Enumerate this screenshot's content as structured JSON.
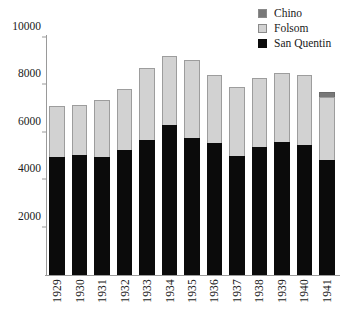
{
  "chart_data": {
    "type": "bar",
    "subtype": "stacked",
    "title": "",
    "xlabel": "",
    "ylabel": "",
    "categories": [
      "1929",
      "1930",
      "1931",
      "1932",
      "1933",
      "1934",
      "1935",
      "1936",
      "1937",
      "1938",
      "1939",
      "1940",
      "1941"
    ],
    "series": [
      {
        "name": "San Quentin",
        "color": "#0b0b0b",
        "values": [
          4980,
          5060,
          4980,
          5270,
          5700,
          6330,
          5780,
          5570,
          5020,
          5400,
          5610,
          5480,
          4850
        ]
      },
      {
        "name": "Folsom",
        "color": "#d2d2d2",
        "values": [
          2150,
          2110,
          2400,
          2580,
          3030,
          2910,
          3290,
          2870,
          2910,
          2910,
          2910,
          2960,
          2660
        ]
      },
      {
        "name": "Chino",
        "color": "#787878",
        "values": [
          0,
          0,
          0,
          0,
          0,
          0,
          0,
          0,
          0,
          0,
          0,
          0,
          210
        ]
      }
    ],
    "totals": [
      7130,
      7170,
      7380,
      7850,
      8730,
      9240,
      9070,
      8440,
      7930,
      8310,
      8520,
      8440,
      7720
    ],
    "ylim": [
      0,
      10000
    ],
    "yticks": [
      2000,
      4000,
      6000,
      8000,
      10000
    ],
    "ytick_labels": [
      "2000",
      "4000",
      "6000",
      "8000",
      "10000"
    ],
    "grid": false,
    "legend_position": "top-right",
    "stack_order": [
      "San Quentin",
      "Folsom",
      "Chino"
    ]
  },
  "legend": {
    "items": [
      {
        "label": "Chino",
        "color": "#787878"
      },
      {
        "label": "Folsom",
        "color": "#d2d2d2"
      },
      {
        "label": "San Quentin",
        "color": "#0b0b0b"
      }
    ]
  },
  "axes": {
    "y_tick_labels": [
      "10000",
      "8000",
      "6000",
      "4000",
      "2000"
    ],
    "x_tick_labels": [
      "1929",
      "1930",
      "1931",
      "1932",
      "1933",
      "1934",
      "1935",
      "1936",
      "1937",
      "1938",
      "1939",
      "1940",
      "1941"
    ]
  }
}
